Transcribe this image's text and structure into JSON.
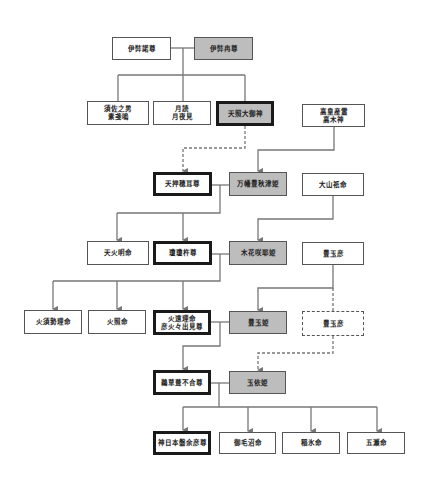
{
  "diagram": {
    "type": "genealogy",
    "colors": {
      "line": "#777777",
      "gray_fill": "#bdbdbd",
      "border": "#555555",
      "thick_border": "#1a1a1a"
    },
    "nodes": [
      {
        "id": "izanagi",
        "label": "伊弉諾尊",
        "x": 112,
        "y": 37,
        "w": 59,
        "h": 23,
        "style": "plain"
      },
      {
        "id": "izanami",
        "label": "伊弉冉尊",
        "x": 194,
        "y": 37,
        "w": 59,
        "h": 23,
        "style": "gray"
      },
      {
        "id": "susanoo",
        "label": "須佐之男\n素戔嗚",
        "x": 87,
        "y": 101,
        "w": 62,
        "h": 24,
        "style": "plain"
      },
      {
        "id": "tsukuyomi",
        "label": "月読\n月夜見",
        "x": 153,
        "y": 101,
        "w": 58,
        "h": 24,
        "style": "plain"
      },
      {
        "id": "amaterasu",
        "label": "天照大御神",
        "x": 216,
        "y": 101,
        "w": 58,
        "h": 25,
        "style": "gray-thick"
      },
      {
        "id": "takamimusubi",
        "label": "高皇産霊\n高木神",
        "x": 302,
        "y": 104,
        "w": 63,
        "h": 23,
        "style": "plain"
      },
      {
        "id": "oshihomimi",
        "label": "天押穂耳尊",
        "x": 153,
        "y": 172,
        "w": 59,
        "h": 24,
        "style": "thick"
      },
      {
        "id": "yorozuhata",
        "label": "万幡豊秋津姫",
        "x": 229,
        "y": 172,
        "w": 58,
        "h": 24,
        "style": "gray"
      },
      {
        "id": "oyamatsumi",
        "label": "大山祇命",
        "x": 302,
        "y": 173,
        "w": 62,
        "h": 23,
        "style": "plain"
      },
      {
        "id": "honoakari",
        "label": "天火明命",
        "x": 87,
        "y": 241,
        "w": 62,
        "h": 24,
        "style": "plain"
      },
      {
        "id": "ninigi",
        "label": "瓊瓊杵尊",
        "x": 153,
        "y": 241,
        "w": 59,
        "h": 24,
        "style": "thick"
      },
      {
        "id": "konohanasakuya",
        "label": "木花咲耶姫",
        "x": 229,
        "y": 241,
        "w": 58,
        "h": 24,
        "style": "gray"
      },
      {
        "id": "toyotamahiko1",
        "label": "豊玉彦",
        "x": 302,
        "y": 242,
        "w": 62,
        "h": 23,
        "style": "plain"
      },
      {
        "id": "hosuseri",
        "label": "火須勢理命",
        "x": 24,
        "y": 310,
        "w": 58,
        "h": 24,
        "style": "plain"
      },
      {
        "id": "hoderi",
        "label": "火照命",
        "x": 88,
        "y": 310,
        "w": 58,
        "h": 24,
        "style": "plain"
      },
      {
        "id": "hoori",
        "label": "火遠理命\n彦火々出見尊",
        "x": 153,
        "y": 310,
        "w": 58,
        "h": 25,
        "style": "thick"
      },
      {
        "id": "toyotamahime",
        "label": "豊玉姫",
        "x": 229,
        "y": 311,
        "w": 58,
        "h": 23,
        "style": "gray"
      },
      {
        "id": "toyotamahiko2",
        "label": "豊玉彦",
        "x": 302,
        "y": 311,
        "w": 62,
        "h": 25,
        "style": "dashed"
      },
      {
        "id": "ugayafukiaezu",
        "label": "鵜草葺不合尊",
        "x": 153,
        "y": 370,
        "w": 58,
        "h": 25,
        "style": "thick"
      },
      {
        "id": "tamayorihime",
        "label": "玉依姫",
        "x": 229,
        "y": 371,
        "w": 57,
        "h": 23,
        "style": "gray"
      },
      {
        "id": "jimmu",
        "label": "神日本磐余彦尊",
        "x": 153,
        "y": 431,
        "w": 58,
        "h": 24,
        "style": "thick"
      },
      {
        "id": "mikenu",
        "label": "御毛沼命",
        "x": 219,
        "y": 432,
        "w": 57,
        "h": 22,
        "style": "plain"
      },
      {
        "id": "inahi",
        "label": "稲氷命",
        "x": 282,
        "y": 432,
        "w": 58,
        "h": 22,
        "style": "plain"
      },
      {
        "id": "itsuse",
        "label": "五瀬命",
        "x": 347,
        "y": 432,
        "w": 58,
        "h": 22,
        "style": "plain"
      }
    ],
    "links": [
      {
        "d": "M171 48 H194",
        "dash": false,
        "arrow": false
      },
      {
        "d": "M183 48 V75",
        "dash": false,
        "arrow": false
      },
      {
        "d": "M118 75 H245",
        "dash": false,
        "arrow": false
      },
      {
        "d": "M118 75 V101",
        "dash": false,
        "arrow": false
      },
      {
        "d": "M183 75 V101",
        "dash": false,
        "arrow": false
      },
      {
        "d": "M245 75 V101",
        "dash": false,
        "arrow": false
      },
      {
        "d": "M245 126 V148 H183 V171",
        "dash": true,
        "arrow": true
      },
      {
        "d": "M334 127 V150 H258 V171",
        "dash": false,
        "arrow": true
      },
      {
        "d": "M212 185 H229",
        "dash": false,
        "arrow": false
      },
      {
        "d": "M220 185 V213 H117",
        "dash": false,
        "arrow": false
      },
      {
        "d": "M117 213 V240",
        "dash": false,
        "arrow": true
      },
      {
        "d": "M183 213 V240",
        "dash": false,
        "arrow": true
      },
      {
        "d": "M333 196 V219 H258 V240",
        "dash": false,
        "arrow": true
      },
      {
        "d": "M212 254 H229",
        "dash": false,
        "arrow": false
      },
      {
        "d": "M220 254 V281 H53",
        "dash": false,
        "arrow": false
      },
      {
        "d": "M53 281 V309",
        "dash": false,
        "arrow": true
      },
      {
        "d": "M117 281 V309",
        "dash": false,
        "arrow": true
      },
      {
        "d": "M183 281 V309",
        "dash": false,
        "arrow": true
      },
      {
        "d": "M333 265 V288 H258 V310",
        "dash": false,
        "arrow": true
      },
      {
        "d": "M333 288 V311",
        "dash": true,
        "arrow": false
      },
      {
        "d": "M211 322 H229",
        "dash": false,
        "arrow": false
      },
      {
        "d": "M220 322 V346 H183 V369",
        "dash": false,
        "arrow": true
      },
      {
        "d": "M333 336 V353 H258 V370",
        "dash": true,
        "arrow": true
      },
      {
        "d": "M211 383 H229",
        "dash": false,
        "arrow": false
      },
      {
        "d": "M219 383 V407",
        "dash": false,
        "arrow": false
      },
      {
        "d": "M183 407 H377",
        "dash": false,
        "arrow": false
      },
      {
        "d": "M183 407 V430",
        "dash": false,
        "arrow": true
      },
      {
        "d": "M248 407 V431",
        "dash": false,
        "arrow": true
      },
      {
        "d": "M311 407 V431",
        "dash": false,
        "arrow": true
      },
      {
        "d": "M377 407 V431",
        "dash": false,
        "arrow": true
      }
    ]
  }
}
